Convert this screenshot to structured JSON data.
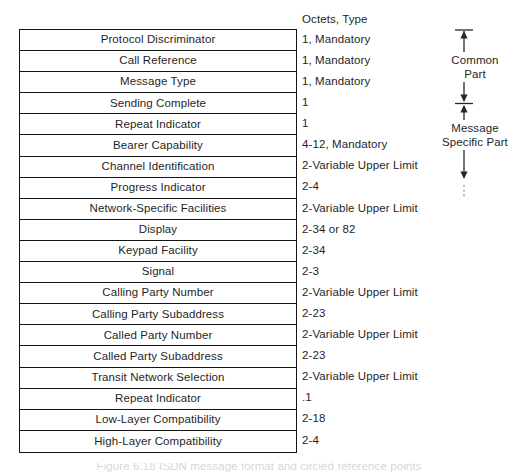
{
  "figure": {
    "octets_header": "Octets, Type",
    "caption": "Figure 6.18   ISDN message format and circled reference points",
    "line_color": "#141414",
    "text_color": "#1f1f1f",
    "background": "#ffffff"
  },
  "rows": [
    {
      "field": "Protocol Discriminator",
      "octets": "1, Mandatory"
    },
    {
      "field": "Call Reference",
      "octets": "1, Mandatory"
    },
    {
      "field": "Message Type",
      "octets": "1, Mandatory"
    },
    {
      "field": "Sending Complete",
      "octets": "1"
    },
    {
      "field": "Repeat Indicator",
      "octets": "1"
    },
    {
      "field": "Bearer Capability",
      "octets": "4-12, Mandatory"
    },
    {
      "field": "Channel Identification",
      "octets": "2-Variable Upper Limit"
    },
    {
      "field": "Progress Indicator",
      "octets": "2-4"
    },
    {
      "field": "Network-Specific Facilities",
      "octets": "2-Variable Upper Limit"
    },
    {
      "field": "Display",
      "octets": "2-34 or 82"
    },
    {
      "field": "Keypad Facility",
      "octets": "2-34"
    },
    {
      "field": "Signal",
      "octets": "2-3"
    },
    {
      "field": "Calling Party Number",
      "octets": "2-Variable Upper Limit"
    },
    {
      "field": "Calling Party Subaddress",
      "octets": "2-23"
    },
    {
      "field": "Called Party Number",
      "octets": "2-Variable Upper Limit"
    },
    {
      "field": "Called Party Subaddress",
      "octets": "2-23"
    },
    {
      "field": "Transit Network Selection",
      "octets": "2-Variable Upper Limit"
    },
    {
      "field": "Repeat Indicator",
      "octets": ".1"
    },
    {
      "field": "Low-Layer Compatibility",
      "octets": "2-18"
    },
    {
      "field": "High-Layer Compatibility",
      "octets": "2-4"
    }
  ],
  "annotations": {
    "common_part": "Common\nPart",
    "common_part_line1": "Common",
    "common_part_line2": "Part",
    "message_specific_part_line1": "Message",
    "message_specific_part_line2": "Specific Part"
  }
}
